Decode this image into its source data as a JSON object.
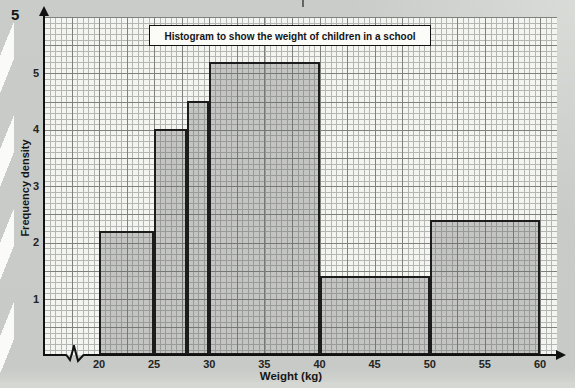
{
  "page": {
    "question_number": "5"
  },
  "chart_data": {
    "type": "bar",
    "title": "Histogram to show the weight of children in a school",
    "xlabel": "Weight (kg)",
    "ylabel": "Frequency density",
    "x_ticks": [
      20,
      25,
      30,
      35,
      40,
      45,
      50,
      55,
      60
    ],
    "y_ticks": [
      1,
      2,
      3,
      4,
      5
    ],
    "xlim": [
      20,
      60
    ],
    "ylim": [
      0,
      6
    ],
    "x_axis_break_before_20": true,
    "grid": "graph paper: minor 0.5 kg / 0.1 density, major 2.5 kg / 0.5 density",
    "legend": "none",
    "bars": [
      {
        "range": "20-25",
        "x0": 20,
        "x1": 25,
        "frequency_density": 2.2
      },
      {
        "range": "25-28",
        "x0": 25,
        "x1": 28,
        "frequency_density": 4.0
      },
      {
        "range": "28-30",
        "x0": 28,
        "x1": 30,
        "frequency_density": 4.5
      },
      {
        "range": "30-40",
        "x0": 30,
        "x1": 40,
        "frequency_density": 5.2
      },
      {
        "range": "40-50",
        "x0": 40,
        "x1": 50,
        "frequency_density": 1.4
      },
      {
        "range": "50-60",
        "x0": 50,
        "x1": 60,
        "frequency_density": 2.4
      }
    ],
    "colors": {
      "page_background": "#c8cbc7",
      "plot_background": "#f4f4f1",
      "minor_grid": "#b3b6b3",
      "major_grid": "#7e817e",
      "bar_fill": "rgba(95,99,95,0.32)",
      "bar_border": "#1c1c1c",
      "axis": "#111111",
      "text": "#161616"
    }
  }
}
